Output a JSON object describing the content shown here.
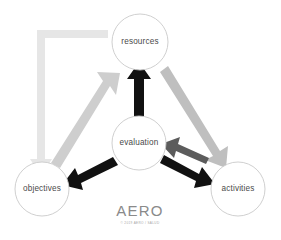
{
  "canvas": {
    "width": 281,
    "height": 240,
    "background": "#ffffff"
  },
  "brand": {
    "title": "AERO",
    "subtitle": "© 2019 AERO / SALUD",
    "title_color": "#8a8a8a",
    "subtitle_color": "#a6a6a6"
  },
  "nodes": [
    {
      "id": "resources",
      "label": "resources",
      "cx": 140,
      "cy": 42,
      "r": 28,
      "fill": "#ffffff",
      "stroke": "#c9c9c9"
    },
    {
      "id": "evaluation",
      "label": "evaluation",
      "cx": 139,
      "cy": 143,
      "r": 27,
      "fill": "#ffffff",
      "stroke": "#c9c9c9"
    },
    {
      "id": "objectives",
      "label": "objectives",
      "cx": 42,
      "cy": 189,
      "r": 27,
      "fill": "#ffffff",
      "stroke": "#c9c9c9"
    },
    {
      "id": "activities",
      "label": "activities",
      "cx": 238,
      "cy": 189,
      "r": 27,
      "fill": "#ffffff",
      "stroke": "#c9c9c9"
    }
  ],
  "arrows": [
    {
      "id": "resources-to-objectives",
      "from": "resources",
      "to": "objectives",
      "color": "#e6e6e6",
      "shape": "elbow",
      "description": "light gray elbow arrow from resources left then down to objectives"
    },
    {
      "id": "objectives-to-resources",
      "from": "objectives",
      "to": "resources",
      "color": "#cecece",
      "shape": "diagonal",
      "description": "light gray diagonal arrow up-right from objectives to resources"
    },
    {
      "id": "resources-to-activities",
      "from": "resources",
      "to": "activities",
      "color": "#bfbfbf",
      "shape": "diagonal",
      "description": "gray diagonal arrow down-right from resources to activities"
    },
    {
      "id": "evaluation-to-resources",
      "from": "evaluation",
      "to": "resources",
      "color": "#111111",
      "shape": "vertical",
      "description": "black vertical arrow up from evaluation to resources"
    },
    {
      "id": "evaluation-to-objectives",
      "from": "evaluation",
      "to": "objectives",
      "color": "#111111",
      "shape": "diagonal",
      "description": "black diagonal arrow down-left from evaluation to objectives"
    },
    {
      "id": "evaluation-to-activities",
      "from": "evaluation",
      "to": "activities",
      "color": "#111111",
      "shape": "diagonal",
      "description": "black diagonal arrow down-right from evaluation to activities"
    },
    {
      "id": "activities-to-evaluation",
      "from": "activities",
      "to": "evaluation",
      "color": "#5c5c5c",
      "shape": "diagonal",
      "description": "dark gray diagonal arrow up-left from activities to evaluation"
    }
  ]
}
